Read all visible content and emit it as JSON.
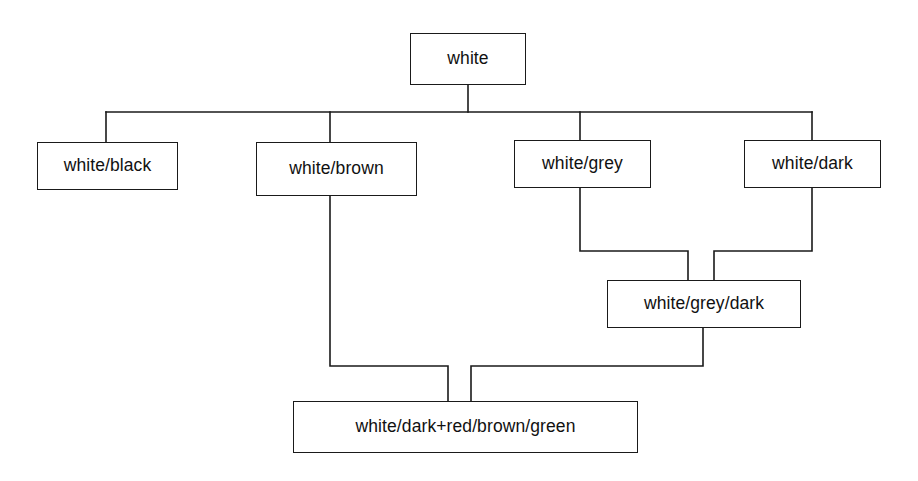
{
  "diagram": {
    "type": "hierarchy-tree",
    "canvas": {
      "width": 918,
      "height": 481
    },
    "style": {
      "background_color": "#ffffff",
      "line_color": "#1a1a1a",
      "box_border_color": "#1a1a1a",
      "box_fill_color": "#ffffff",
      "text_color": "#111111"
    },
    "nodes": [
      {
        "id": "white",
        "label": "white",
        "x": 410,
        "y": 33,
        "w": 116,
        "h": 52,
        "level": 0
      },
      {
        "id": "white-black",
        "label": "white/black",
        "x": 37,
        "y": 142,
        "w": 141,
        "h": 48,
        "level": 1
      },
      {
        "id": "white-brown",
        "label": "white/brown",
        "x": 256,
        "y": 142,
        "w": 161,
        "h": 54,
        "level": 1
      },
      {
        "id": "white-grey",
        "label": "white/grey",
        "x": 514,
        "y": 140,
        "w": 137,
        "h": 48,
        "level": 1
      },
      {
        "id": "white-dark",
        "label": "white/dark",
        "x": 744,
        "y": 140,
        "w": 137,
        "h": 48,
        "level": 1
      },
      {
        "id": "white-grey-dark",
        "label": "white/grey/dark",
        "x": 607,
        "y": 280,
        "w": 194,
        "h": 48,
        "level": 2
      },
      {
        "id": "white-dark-red-brown-green",
        "label": "white/dark+red/brown/green",
        "x": 293,
        "y": 401,
        "w": 345,
        "h": 52,
        "level": 3
      }
    ],
    "edges": [
      {
        "from": "white",
        "to": "white-black"
      },
      {
        "from": "white",
        "to": "white-brown"
      },
      {
        "from": "white",
        "to": "white-grey"
      },
      {
        "from": "white",
        "to": "white-dark"
      },
      {
        "from": "white-grey",
        "to": "white-grey-dark"
      },
      {
        "from": "white-dark",
        "to": "white-grey-dark"
      },
      {
        "from": "white-brown",
        "to": "white-dark-red-brown-green"
      },
      {
        "from": "white-grey-dark",
        "to": "white-dark-red-brown-green"
      }
    ],
    "connector_paths": [
      "M468 85 L468 112",
      "M106 112 L812 112",
      "M106 112 L106 142",
      "M330 112 L330 142",
      "M580 112 L580 140",
      "M812 112 L812 140",
      "M580 188 L580 251 L688 251 L688 280",
      "M812 188 L812 251 L714 251 L714 280",
      "M330 196 L330 366 L448 366 L448 401",
      "M703 328 L703 366 L471 366 L471 401"
    ]
  }
}
